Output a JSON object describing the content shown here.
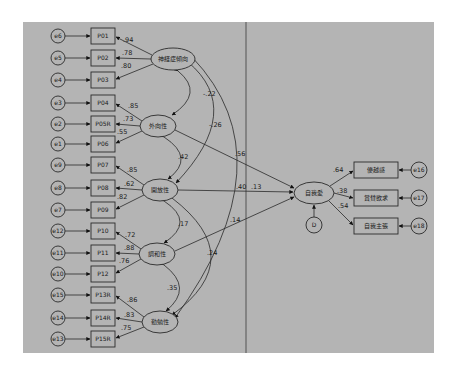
{
  "diagram": {
    "type": "structural-equation-model",
    "background_color": "#b4b4b4",
    "latents": {
      "neuroticism": "神経症傾向",
      "extraversion": "外向性",
      "openness": "開放性",
      "agreeableness": "調和性",
      "conscientiousness": "勤勉性",
      "narcissism": "自我愛",
      "disturbance": "D"
    },
    "indicators": [
      "P01",
      "P02",
      "P03",
      "P04",
      "P05R",
      "P06",
      "P07",
      "P08",
      "P09",
      "P10",
      "P11",
      "P12",
      "P13R",
      "P14R",
      "P15R"
    ],
    "errors": [
      "e6",
      "e5",
      "e4",
      "e3",
      "e2",
      "e1",
      "e9",
      "e8",
      "e7",
      "e12",
      "e11",
      "e10",
      "e15",
      "e14",
      "e13"
    ],
    "loadings": [
      ".94",
      ".78",
      ".80",
      ".85",
      ".73",
      ".55",
      ".85",
      ".62",
      ".82",
      ".72",
      ".88",
      ".76",
      ".86",
      ".83",
      ".75"
    ],
    "outcome_indicators": [
      "優越感",
      "賞賛欲求",
      "自我主張"
    ],
    "outcome_errors": [
      "e16",
      "e17",
      "e18"
    ],
    "outcome_loadings": [
      ".64",
      ".38",
      ".54"
    ],
    "correlations": {
      "neuroticism_extraversion": "-.22",
      "neuroticism_openness": "-.26",
      "extraversion_openness": ".42",
      "openness_agreeableness": ".17",
      "openness_conscientiousness": ".24",
      "agreeableness_conscientiousness": ".35"
    },
    "paths": {
      "extraversion_to_narcissism": ".56",
      "openness_to_narcissism": ".40",
      "neuroticism_to_narcissism": ".13",
      "agreeableness_to_narcissism": ".14"
    }
  }
}
